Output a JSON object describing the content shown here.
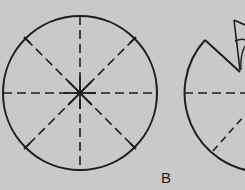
{
  "figure": {
    "label": "B",
    "colors": {
      "background": "#c9c9c9",
      "line": "#1e1e1e"
    },
    "left_circle": {
      "description": "full circle divided into 8 sectors by dashed fold lines",
      "center": [
        80,
        93
      ],
      "radius": 77,
      "fold_lines": 4
    },
    "right_shape": {
      "description": "circle with one sector cut out and folded into a cone",
      "center": [
        262,
        93
      ],
      "radius": 79
    }
  }
}
